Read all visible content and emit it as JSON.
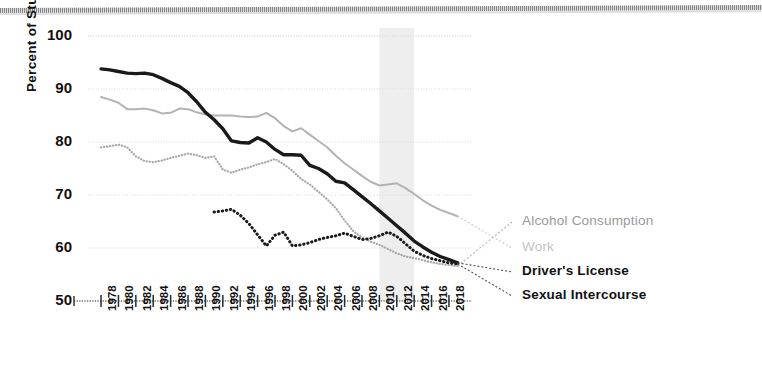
{
  "chart_data": {
    "type": "line",
    "title": "",
    "subtitle": "",
    "xlabel": "",
    "ylabel": "Percent of Students",
    "xlim": [
      1976.5,
      2019.5
    ],
    "ylim": [
      50,
      100
    ],
    "yticks": [
      50,
      60,
      70,
      80,
      90,
      100
    ],
    "grid": true,
    "legend_position": "right-inline",
    "x": [
      1978,
      1979,
      1980,
      1981,
      1982,
      1983,
      1984,
      1985,
      1986,
      1987,
      1988,
      1989,
      1990,
      1991,
      1992,
      1993,
      1994,
      1995,
      1996,
      1997,
      1998,
      1999,
      2000,
      2001,
      2002,
      2003,
      2004,
      2005,
      2006,
      2007,
      2008,
      2009,
      2010,
      2011,
      2012,
      2013,
      2014,
      2015,
      2016,
      2017,
      2018,
      2019
    ],
    "xticks": [
      1978,
      1980,
      1982,
      1984,
      1986,
      1988,
      1990,
      1992,
      1994,
      1996,
      1998,
      2000,
      2002,
      2004,
      2006,
      2008,
      2010,
      2012,
      2014,
      2016,
      2018
    ],
    "xtick_labels": [
      "1978",
      "1980",
      "1982",
      "1984",
      "1986",
      "1988",
      "1990",
      "1992",
      "1994",
      "1996",
      "1998",
      "2000",
      "2002",
      "2004",
      "2006",
      "2008",
      "2010",
      "2012",
      "2014",
      "2016",
      "2018"
    ],
    "shaded_region": {
      "x0": 2010,
      "x1": 2014,
      "color": "#ececec",
      "label": ""
    },
    "series": [
      {
        "name": "Alcohol Consumption",
        "style": "dotted",
        "color": "#a8a8a8",
        "width": 2.2,
        "values": [
          79.0,
          79.2,
          79.5,
          79.0,
          77.3,
          76.4,
          76.2,
          76.5,
          77.0,
          77.4,
          77.8,
          77.5,
          77.0,
          77.3,
          74.8,
          74.2,
          74.8,
          75.2,
          75.8,
          76.2,
          76.8,
          75.8,
          74.6,
          73.0,
          72.0,
          70.6,
          69.2,
          67.5,
          65.2,
          63.2,
          62.0,
          61.2,
          60.6,
          59.8,
          59.0,
          58.4,
          58.1,
          57.7,
          57.3,
          57.0,
          56.8,
          56.6
        ]
      },
      {
        "name": "Work",
        "style": "solid",
        "color": "#b3b3b3",
        "width": 2.0,
        "values": [
          88.5,
          88.0,
          87.4,
          86.2,
          86.2,
          86.3,
          86.0,
          85.4,
          85.5,
          86.3,
          86.2,
          85.6,
          85.2,
          85.0,
          85.0,
          85.0,
          84.8,
          84.7,
          84.8,
          85.5,
          84.5,
          83.0,
          82.0,
          82.6,
          81.4,
          80.2,
          79.0,
          77.4,
          76.0,
          74.8,
          73.6,
          72.5,
          71.8,
          72.0,
          72.2,
          71.3,
          70.2,
          69.0,
          68.0,
          67.2,
          66.6,
          66.0
        ]
      },
      {
        "name": "Driver's License",
        "style": "solid",
        "color": "#1a1a1a",
        "width": 3.4,
        "values": [
          93.8,
          93.6,
          93.3,
          93.0,
          92.9,
          93.0,
          92.7,
          92.0,
          91.2,
          90.5,
          89.3,
          87.6,
          85.6,
          84.2,
          82.5,
          80.2,
          79.9,
          79.8,
          80.8,
          80.0,
          78.6,
          77.6,
          77.6,
          77.5,
          75.6,
          75.0,
          74.0,
          72.6,
          72.3,
          71.0,
          69.7,
          68.4,
          67.0,
          65.6,
          64.2,
          62.8,
          61.3,
          60.2,
          59.2,
          58.4,
          57.8,
          57.2
        ]
      },
      {
        "name": "Sexual Intercourse",
        "style": "dotted",
        "color": "#1a1a1a",
        "width": 3.0,
        "values": [
          null,
          null,
          null,
          null,
          null,
          null,
          null,
          null,
          null,
          null,
          null,
          null,
          null,
          66.8,
          67.0,
          67.3,
          66.2,
          64.6,
          62.5,
          60.4,
          62.4,
          63.0,
          60.4,
          60.6,
          61.0,
          61.6,
          62.0,
          62.3,
          62.8,
          62.2,
          61.6,
          61.8,
          62.3,
          63.0,
          62.2,
          60.8,
          59.4,
          58.6,
          58.0,
          57.6,
          57.2,
          57.0
        ]
      }
    ]
  },
  "axes": {
    "ytick_labels": [
      "100",
      "90",
      "80",
      "70",
      "60",
      "50"
    ],
    "ylabel": "Percent of Students"
  },
  "legend": {
    "items": [
      {
        "label": "Alcohol Consumption",
        "color": "#9a9a9a"
      },
      {
        "label": "Work",
        "color": "#c2c2c2"
      },
      {
        "label": "Driver's License",
        "color": "#111111"
      },
      {
        "label": "Sexual Intercourse",
        "color": "#111111"
      }
    ]
  }
}
